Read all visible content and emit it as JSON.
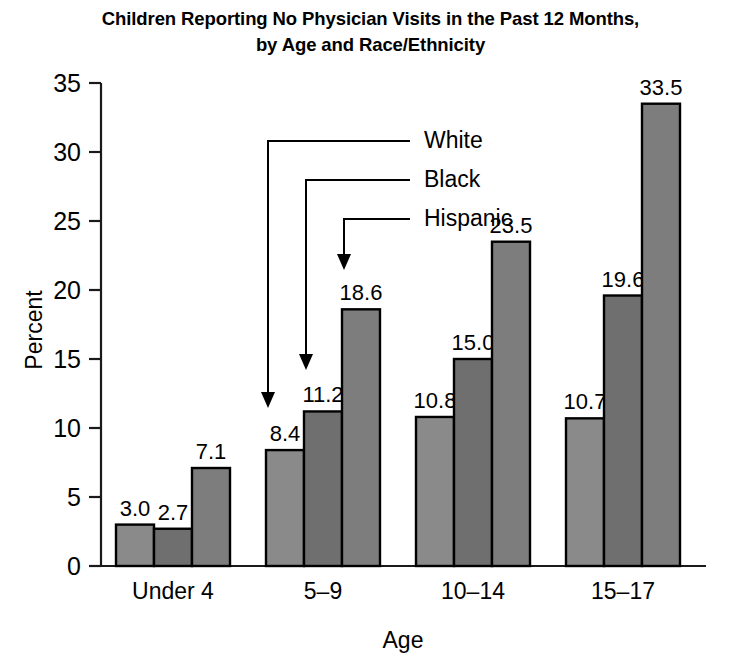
{
  "chart_data": {
    "type": "bar",
    "title": "Children Reporting No Physician Visits in the Past 12 Months, by Age and Race/Ethnicity",
    "title_lines": [
      "Children Reporting No Physician Visits in the Past 12 Months,",
      "by Age and Race/Ethnicity"
    ],
    "xlabel": "Age",
    "ylabel": "Percent",
    "ylim": [
      0,
      35
    ],
    "ytick_labels": [
      "0",
      "5",
      "10",
      "15",
      "20",
      "25",
      "30",
      "35"
    ],
    "yticks": [
      0,
      5,
      10,
      15,
      20,
      25,
      30,
      35
    ],
    "grid": false,
    "legend_position": "inline-annotations",
    "categories": [
      "Under 4",
      "5–9",
      "10–14",
      "15–17"
    ],
    "series": [
      {
        "name": "White",
        "values": [
          3.0,
          8.4,
          10.8,
          10.7
        ],
        "labels": [
          "3.0",
          "8.4",
          "10.8",
          "10.7"
        ],
        "color": "#8a8a8a"
      },
      {
        "name": "Black",
        "values": [
          2.7,
          11.2,
          15.0,
          19.6
        ],
        "labels": [
          "2.7",
          "11.2",
          "15.0",
          "19.6"
        ],
        "color": "#6f6f6f"
      },
      {
        "name": "Hispanic",
        "values": [
          7.1,
          18.6,
          23.5,
          33.5
        ],
        "labels": [
          "7.1",
          "18.6",
          "23.5",
          "33.5"
        ],
        "color": "#7d7d7d"
      }
    ],
    "annotations": [
      {
        "label": "White",
        "target_series": "White"
      },
      {
        "label": "Black",
        "target_series": "Black"
      },
      {
        "label": "Hispanic",
        "target_series": "Hispanic"
      }
    ]
  }
}
